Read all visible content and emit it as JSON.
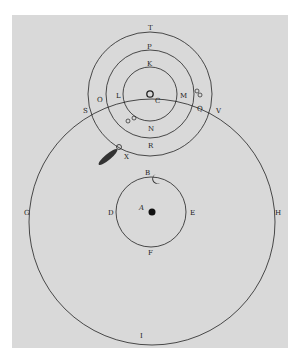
{
  "diagram": {
    "colors": {
      "background": "#d9d9d9",
      "page": "#ffffff",
      "ink": "#222222"
    },
    "labels": {
      "T": "T",
      "P": "P",
      "K": "K",
      "C": "C",
      "L": "L",
      "M": "M",
      "O": "O",
      "S": "S",
      "V": "V",
      "Q": "Q",
      "N": "N",
      "R": "R",
      "X": "X",
      "B": "B",
      "D": "D",
      "E": "E",
      "F": "F",
      "A": "A",
      "G": "G",
      "H": "H",
      "I": "I"
    },
    "symbols": {
      "sun": "sun-symbol",
      "earth": "earth-dot",
      "moon": "crescent-moon-symbol",
      "comet": "comet",
      "mercury": "mercury-symbol",
      "venus": "venus-symbol"
    }
  }
}
